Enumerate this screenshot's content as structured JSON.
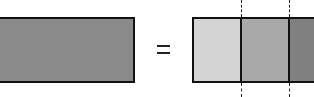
{
  "diagram": {
    "whole": {
      "color": "#8a8a8a",
      "border": "#111111"
    },
    "operator": "=",
    "parts": [
      {
        "color": "#d4d4d4"
      },
      {
        "color": "#a9a9a9"
      },
      {
        "color": "#808080"
      }
    ],
    "dashed_guides": 2
  }
}
